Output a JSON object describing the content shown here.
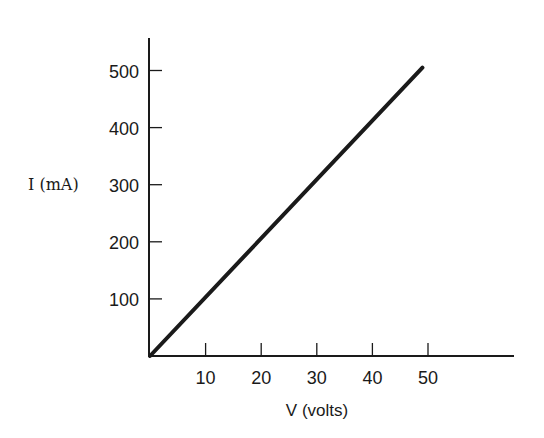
{
  "chart_data": {
    "type": "line",
    "title": "",
    "xlabel": "V (volts)",
    "ylabel": "I (mA)",
    "xlim": [
      0,
      65
    ],
    "ylim": [
      0,
      550
    ],
    "x_ticks": [
      10,
      20,
      30,
      40,
      50
    ],
    "y_ticks": [
      100,
      200,
      300,
      400,
      500
    ],
    "x_tick_labels": [
      "10",
      "20",
      "30",
      "40",
      "50"
    ],
    "y_tick_labels": [
      "100",
      "200",
      "300",
      "400",
      "500"
    ],
    "grid": false,
    "legend": null,
    "series": [
      {
        "name": "I vs V",
        "x": [
          0,
          49
        ],
        "y": [
          0,
          505
        ],
        "color": "#1a1a1a"
      }
    ]
  }
}
